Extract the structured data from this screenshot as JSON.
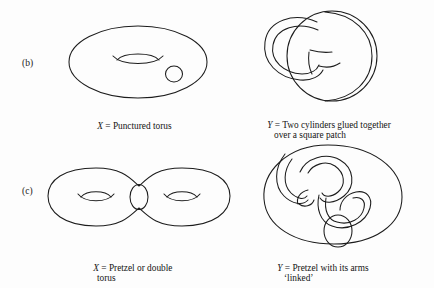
{
  "page": {
    "background_color": "#fdfdfd",
    "ink_color": "#1c1c1c"
  },
  "rows": [
    {
      "key": "b",
      "label": "(b)",
      "left": {
        "figure_name": "punctured-torus",
        "caption_var": "X",
        "caption_eq": "=",
        "caption_line1": "Punctured torus",
        "caption_line2": ""
      },
      "right": {
        "figure_name": "two-cylinders-glued",
        "caption_var": "Y",
        "caption_eq": "=",
        "caption_line1": "Two cylinders glued together",
        "caption_line2": "over a square patch"
      }
    },
    {
      "key": "c",
      "label": "(c)",
      "left": {
        "figure_name": "double-torus-pretzel",
        "caption_var": "X",
        "caption_eq": "=",
        "caption_line1": "Pretzel or double",
        "caption_line2": "torus"
      },
      "right": {
        "figure_name": "pretzel-linked-arms",
        "caption_var": "Y",
        "caption_eq": "=",
        "caption_line1": "Pretzel with its arms",
        "caption_line2": "‘linked’"
      }
    }
  ]
}
